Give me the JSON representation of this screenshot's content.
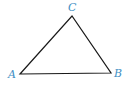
{
  "diagram": {
    "type": "triangle",
    "vertices": [
      {
        "name": "A",
        "x": 20,
        "y": 74
      },
      {
        "name": "B",
        "x": 111,
        "y": 73
      },
      {
        "name": "C",
        "x": 72,
        "y": 16
      }
    ],
    "labels": {
      "A": "A",
      "B": "B",
      "C": "C"
    },
    "colors": {
      "label": "#3f8fc4",
      "stroke": "#1a1a1a"
    }
  }
}
